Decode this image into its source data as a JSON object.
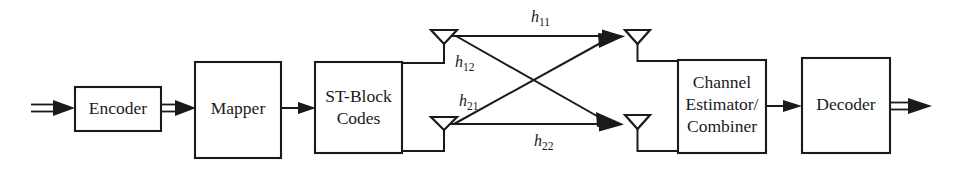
{
  "diagram": {
    "type": "block-diagram",
    "background_color": "#ffffff",
    "line_color": "#1a1a1a",
    "blocks": [
      {
        "id": "encoder",
        "label": "Encoder",
        "lines": [
          "Encoder"
        ],
        "x": 75,
        "y": 87,
        "w": 86,
        "h": 44
      },
      {
        "id": "mapper",
        "label": "Mapper",
        "lines": [
          "Mapper"
        ],
        "x": 195,
        "y": 62,
        "w": 86,
        "h": 96
      },
      {
        "id": "stblock",
        "label": "ST-Block Codes",
        "lines": [
          "ST-Block",
          "Codes"
        ],
        "x": 315,
        "y": 62,
        "w": 87,
        "h": 91
      },
      {
        "id": "chanest",
        "label": "Channel Estimator/Combiner",
        "lines": [
          "Channel",
          "Estimator/",
          "Combiner"
        ],
        "x": 678,
        "y": 60,
        "w": 88,
        "h": 93
      },
      {
        "id": "decoder",
        "label": "Decoder",
        "lines": [
          "Decoder"
        ],
        "x": 802,
        "y": 58,
        "w": 88,
        "h": 95
      }
    ],
    "antennas": [
      {
        "id": "tx1",
        "role": "transmit",
        "index": 1,
        "cx": 444,
        "top": 30,
        "stem_bottom": 57
      },
      {
        "id": "tx2",
        "role": "transmit",
        "index": 2,
        "cx": 444,
        "top": 117,
        "stem_bottom": 148
      },
      {
        "id": "rx1",
        "role": "receive",
        "index": 1,
        "cx": 637,
        "top": 30,
        "stem_bottom": 62
      },
      {
        "id": "rx2",
        "role": "receive",
        "index": 2,
        "cx": 637,
        "top": 115,
        "stem_bottom": 148
      }
    ],
    "channels": [
      {
        "id": "h11",
        "base": "h",
        "sub": "11",
        "from": "tx1",
        "to": "rx1",
        "label_x": 531,
        "label_y": 22
      },
      {
        "id": "h12",
        "base": "h",
        "sub": "12",
        "from": "tx1",
        "to": "rx2",
        "label_x": 455,
        "label_y": 67
      },
      {
        "id": "h21",
        "base": "h",
        "sub": "21",
        "from": "tx2",
        "to": "rx1",
        "label_x": 459,
        "label_y": 106
      },
      {
        "id": "h22",
        "base": "h",
        "sub": "22",
        "from": "tx2",
        "to": "rx2",
        "label_x": 534,
        "label_y": 146
      }
    ],
    "signal_flow": [
      {
        "id": "input",
        "kind": "double-arrow",
        "from": "source",
        "to": "encoder"
      },
      {
        "id": "encoder-mapper",
        "kind": "double-arrow",
        "from": "encoder",
        "to": "mapper"
      },
      {
        "id": "mapper-stblock",
        "kind": "single-arrow",
        "from": "mapper",
        "to": "stblock"
      },
      {
        "id": "stblock-tx1",
        "kind": "wire",
        "from": "stblock",
        "to": "tx1"
      },
      {
        "id": "stblock-tx2",
        "kind": "wire",
        "from": "stblock",
        "to": "tx2"
      },
      {
        "id": "rx1-chanest",
        "kind": "wire",
        "from": "rx1",
        "to": "chanest"
      },
      {
        "id": "rx2-chanest",
        "kind": "wire",
        "from": "rx2",
        "to": "chanest"
      },
      {
        "id": "chanest-decoder",
        "kind": "single-arrow",
        "from": "chanest",
        "to": "decoder"
      },
      {
        "id": "output",
        "kind": "double-arrow",
        "from": "decoder",
        "to": "sink"
      }
    ]
  }
}
